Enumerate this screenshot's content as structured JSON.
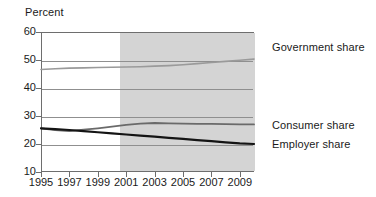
{
  "chart_data": {
    "type": "line",
    "title": "",
    "ylabel": "Percent",
    "xlabel": "",
    "ylim": [
      10,
      60
    ],
    "xlim": [
      1995,
      2010
    ],
    "yticks": [
      10,
      20,
      30,
      40,
      50,
      60
    ],
    "xticks": [
      1995,
      1997,
      1999,
      2001,
      2003,
      2005,
      2007,
      2009
    ],
    "grid": "horizontal",
    "legend_position": "right-inline",
    "shaded_region": {
      "label": "",
      "x_start": 2000.5,
      "x_end": 2010,
      "color": "#d4d4d4"
    },
    "x": [
      1995,
      1996,
      1997,
      1998,
      1999,
      2000,
      2001,
      2002,
      2003,
      2004,
      2005,
      2006,
      2007,
      2008,
      2009,
      2010
    ],
    "series": [
      {
        "name": "Government share",
        "color": "#9a9a9a",
        "values": [
          46.6,
          46.9,
          47.1,
          47.2,
          47.3,
          47.4,
          47.5,
          47.6,
          47.8,
          48.0,
          48.3,
          48.7,
          49.1,
          49.5,
          49.9,
          50.3
        ]
      },
      {
        "name": "Consumer share",
        "color": "#6a6a6a",
        "values": [
          25.6,
          25.0,
          24.6,
          25.1,
          25.6,
          26.2,
          26.8,
          27.3,
          27.5,
          27.4,
          27.3,
          27.2,
          27.2,
          27.1,
          27.0,
          27.0
        ]
      },
      {
        "name": "Employer share",
        "color": "#141414",
        "values": [
          25.6,
          25.3,
          25.0,
          24.6,
          24.2,
          23.8,
          23.4,
          23.0,
          22.6,
          22.2,
          21.8,
          21.4,
          21.0,
          20.6,
          20.2,
          20.0
        ]
      }
    ]
  },
  "axis": {
    "y_title": "Percent"
  },
  "labels": {
    "government": "Government share",
    "consumer": "Consumer share",
    "employer": "Employer share"
  },
  "colors": {
    "shade": "#d4d4d4",
    "frame": "#6e6e6e",
    "grid": "#8f8f8f",
    "government": "#9a9a9a",
    "consumer": "#6a6a6a",
    "employer": "#141414",
    "text": "#1a1a1a",
    "background": "#ffffff"
  }
}
